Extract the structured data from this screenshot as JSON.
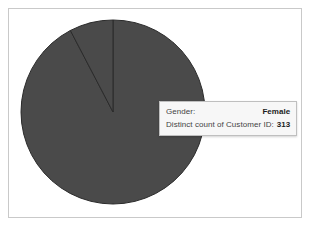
{
  "chart_data": {
    "type": "pie",
    "title": "",
    "labels": [
      "Female",
      "Male"
    ],
    "values": [
      313,
      26
    ],
    "value_label": "Distinct count of Customer ID",
    "category_label": "Gender",
    "colors": [
      "#4a4a4a",
      "#4a4a4a"
    ],
    "slice_colors": {
      "Female": "#4a4a4a",
      "Male": "#4a4a4a"
    },
    "start_angle_deg": 0,
    "legend": "none",
    "grid": false,
    "highlighted_slice": "Female",
    "slice_border_color": "#2b2b2b"
  },
  "frame": {
    "border_color": "#c9c9c9",
    "background": "#ffffff"
  },
  "pie": {
    "center_x": 104,
    "center_y": 103,
    "radius": 92,
    "fill_color": "#4a4a4a",
    "divider_color": "#2b2b2b"
  },
  "tooltip": {
    "rows": [
      {
        "label": "Gender:",
        "value": "Female"
      },
      {
        "label": "Distinct count of Customer ID:",
        "value": "313"
      }
    ],
    "background": "#f7f7f7",
    "border_color": "#bfbfbf"
  }
}
